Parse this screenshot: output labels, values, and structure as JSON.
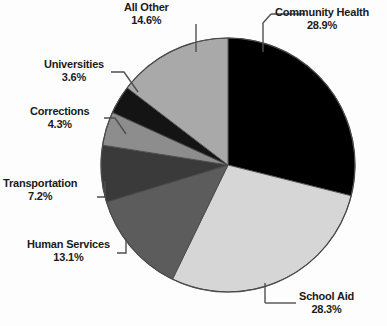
{
  "chart_data": {
    "type": "pie",
    "title": "",
    "subtitle": "",
    "xlabel": "",
    "ylabel": "",
    "legend_position": "none",
    "grid": false,
    "units": "percent",
    "total": 100.0,
    "start_angle_deg": 0,
    "direction": "clockwise",
    "categories": [
      "Community Health",
      "School Aid",
      "Human Services",
      "Transportation",
      "Corrections",
      "Universities",
      "All Other"
    ],
    "values": [
      28.9,
      28.3,
      13.1,
      7.2,
      4.3,
      3.6,
      14.6
    ],
    "slices": [
      {
        "label": "Community Health",
        "value": 28.9,
        "value_text": "28.9%",
        "color": "#000000",
        "label_align": "left",
        "leader": "elbow"
      },
      {
        "label": "School Aid",
        "value": 28.3,
        "value_text": "28.3%",
        "color": "#d6d6d6",
        "label_align": "left",
        "leader": "elbow"
      },
      {
        "label": "Human Services",
        "value": 13.1,
        "value_text": "13.1%",
        "color": "#5c5c5c",
        "label_align": "right",
        "leader": "elbow"
      },
      {
        "label": "Transportation",
        "value": 7.2,
        "value_text": "7.2%",
        "color": "#3a3a3a",
        "label_align": "right",
        "leader": "elbow"
      },
      {
        "label": "Corrections",
        "value": 4.3,
        "value_text": "4.3%",
        "color": "#8d8d8d",
        "label_align": "right",
        "leader": "diagonal"
      },
      {
        "label": "Universities",
        "value": 3.6,
        "value_text": "3.6%",
        "color": "#141414",
        "label_align": "right",
        "leader": "diagonal"
      },
      {
        "label": "All Other",
        "value": 14.6,
        "value_text": "14.6%",
        "color": "#a9a9a9",
        "label_align": "center",
        "leader": "vertical"
      }
    ],
    "colors": {
      "outline": "#4a4a4a",
      "leader_line": "#4f4f4f",
      "text": "#1b1b1b",
      "background": "#fdfdfd"
    }
  }
}
